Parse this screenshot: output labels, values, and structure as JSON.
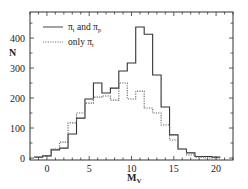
{
  "chart_data": {
    "type": "histogram",
    "title": "",
    "xlabel": "M_V",
    "xlabel_main": "M",
    "xlabel_sub": "V",
    "ylabel": "N",
    "xlim": [
      -2,
      22
    ],
    "ylim": [
      0,
      487
    ],
    "x_ticks": [
      0,
      5,
      10,
      15,
      20
    ],
    "y_ticks": [
      0,
      100,
      200,
      300,
      400
    ],
    "grid": false,
    "legend_position": "upper left",
    "bin_width": 1,
    "bin_centers": [
      -1,
      0,
      1,
      2,
      3,
      4,
      5,
      6,
      7,
      8,
      9,
      10,
      11,
      12,
      13,
      14,
      15,
      16,
      17,
      18,
      19,
      20
    ],
    "series": [
      {
        "name": "π_t and π_p",
        "legend_main": "π",
        "legend_sub1": "t",
        "legend_and": " and ",
        "legend_sub2": "p",
        "style": "solid",
        "values": [
          3,
          7,
          27,
          33,
          80,
          133,
          197,
          250,
          217,
          233,
          290,
          317,
          437,
          413,
          277,
          170,
          77,
          30,
          17,
          5,
          5,
          3
        ]
      },
      {
        "name": "only π_t",
        "legend_prefix": "only ",
        "legend_main": "π",
        "legend_sub1": "t",
        "style": "dotted",
        "values": [
          3,
          7,
          30,
          53,
          117,
          150,
          183,
          203,
          207,
          193,
          250,
          197,
          223,
          167,
          150,
          110,
          60,
          30,
          10,
          3,
          0,
          0
        ]
      }
    ],
    "colors": {
      "axis": "#333333",
      "line": "#333333",
      "dotted": "#666666"
    }
  }
}
